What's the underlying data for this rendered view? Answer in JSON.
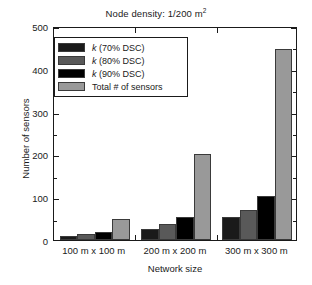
{
  "chart_data": {
    "type": "bar",
    "title_main": "Node density: 1/200 m",
    "title_sup": "2",
    "xlabel": "Network size",
    "ylabel": "Number of sensors",
    "categories": [
      "100 m x 100 m",
      "200 m x 200 m",
      "300 m x 300 m"
    ],
    "series": [
      {
        "name": "k (70% DSC)",
        "name_italic_prefix": "k",
        "name_rest": " (70% DSC)",
        "color": "#1a1a1a",
        "values": [
          10,
          26,
          53
        ]
      },
      {
        "name": "k (80% DSC)",
        "name_italic_prefix": "k",
        "name_rest": " (80% DSC)",
        "color": "#595959",
        "values": [
          13,
          37,
          71
        ]
      },
      {
        "name": "k (90% DSC)",
        "name_italic_prefix": "k",
        "name_rest": " (90% DSC)",
        "color": "#000000",
        "values": [
          19,
          53,
          103
        ]
      },
      {
        "name": "Total # of sensors",
        "name_italic_prefix": "",
        "name_rest": "Total # of sensors",
        "color": "#999999",
        "values": [
          49,
          200,
          447
        ]
      }
    ],
    "ylim": [
      0,
      500
    ],
    "yticks": [
      0,
      100,
      200,
      300,
      400,
      500
    ],
    "ytick_labels": [
      "0",
      "100",
      "200",
      "300",
      "400",
      "500"
    ],
    "yminor_ticks": [
      50,
      150,
      250,
      350,
      450
    ],
    "grid": false,
    "legend_position": "upper left"
  }
}
